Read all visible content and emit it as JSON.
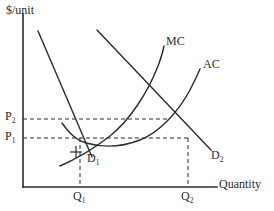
{
  "figure": {
    "kind": "economics-cost-curve-diagram",
    "background_color": "#ffffff",
    "line_color": "#2b2b2b",
    "width": 274,
    "height": 211
  },
  "axes": {
    "y_label": "$/unit",
    "x_label": "Quantity",
    "origin": {
      "x": 23,
      "y": 187
    },
    "y_top": 14,
    "x_right": 217
  },
  "price_ticks": [
    {
      "id": "p2",
      "label": "P",
      "subscript": "2",
      "y": 119,
      "dash_to_x": 170
    },
    {
      "id": "p1",
      "label": "P",
      "subscript": "1",
      "y": 138,
      "dash_to_x": 188
    }
  ],
  "quantity_ticks": [
    {
      "id": "q1",
      "label": "Q",
      "subscript": "1",
      "x": 80,
      "dash_from_y": 138
    },
    {
      "id": "q2",
      "label": "Q",
      "subscript": "2",
      "x": 188,
      "dash_from_y": 138
    }
  ],
  "curves": [
    {
      "id": "mc",
      "label": "MC",
      "label_sub": "",
      "description": "marginal cost curve, rising steeply",
      "path": "M 60,166 C 74,160 92,150 110,136 C 130,120 148,92 158,66 C 161,58 163,51 164,46"
    },
    {
      "id": "ac",
      "label": "AC",
      "label_sub": "",
      "description": "average cost curve, U-shaped",
      "path": "M 62,123 C 70,134 76,140 86,143 C 104,148 122,147 140,140 C 160,132 178,112 190,90 C 195,80 198,74 200,69"
    },
    {
      "id": "d1",
      "label": "D",
      "label_sub": "1",
      "description": "demand curve 1, downward sloping straight line",
      "path": "M 38,31 L 92,157"
    },
    {
      "id": "d2",
      "label": "D",
      "label_sub": "2",
      "description": "demand curve 2, downward sloping straight line",
      "path": "M 97,30 L 211,150"
    }
  ],
  "markers": [
    {
      "id": "d1-cross-tick",
      "x": 76,
      "y": 152,
      "size": 8
    }
  ]
}
